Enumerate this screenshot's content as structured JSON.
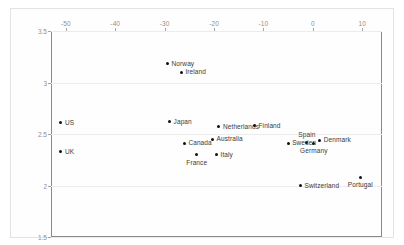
{
  "chart_data": {
    "type": "scatter",
    "title": "",
    "xlabel": "",
    "ylabel": "",
    "xlim": [
      -53,
      14
    ],
    "ylim": [
      1.5,
      3.5
    ],
    "xticks": [
      -50,
      -40,
      -30,
      -20,
      -10,
      0,
      10
    ],
    "xtick_labels": [
      "-50",
      "-40",
      "-30",
      "-20",
      "-10",
      "0",
      "10"
    ],
    "yticks": [
      1.5,
      2,
      2.5,
      3,
      3.5
    ],
    "ytick_labels": [
      "1.5",
      "2",
      "2.5",
      "3",
      "3.5"
    ],
    "grid": true,
    "grid_axis": "y",
    "legend": "none",
    "marker_color": "#111111",
    "points": [
      {
        "label": "Norway",
        "x": -29.4,
        "y": 3.18,
        "label_pos": "right"
      },
      {
        "label": "Ireland",
        "x": -26.6,
        "y": 3.1,
        "label_pos": "right"
      },
      {
        "label": "US",
        "x": -51.0,
        "y": 2.61,
        "label_pos": "right"
      },
      {
        "label": "Japan",
        "x": -29.0,
        "y": 2.62,
        "label_pos": "right"
      },
      {
        "label": "Netherlands",
        "x": -19.0,
        "y": 2.57,
        "label_pos": "right"
      },
      {
        "label": "Finland",
        "x": -11.8,
        "y": 2.58,
        "label_pos": "right"
      },
      {
        "label": "Spain",
        "x": -1.2,
        "y": 2.42,
        "label_pos": "above"
      },
      {
        "label": "Denmark",
        "x": 1.4,
        "y": 2.44,
        "label_pos": "right"
      },
      {
        "label": "Australia",
        "x": -20.3,
        "y": 2.45,
        "label_pos": "right"
      },
      {
        "label": "Canada",
        "x": -26.0,
        "y": 2.41,
        "label_pos": "right"
      },
      {
        "label": "Sweden",
        "x": -5.0,
        "y": 2.41,
        "label_pos": "right"
      },
      {
        "label": "Germany",
        "x": 0.2,
        "y": 2.41,
        "label_pos": "below"
      },
      {
        "label": "UK",
        "x": -51.0,
        "y": 2.33,
        "label_pos": "right"
      },
      {
        "label": "France",
        "x": -23.5,
        "y": 2.3,
        "label_pos": "below"
      },
      {
        "label": "Italy",
        "x": -19.5,
        "y": 2.3,
        "label_pos": "right"
      },
      {
        "label": "Switzerland",
        "x": -2.5,
        "y": 2.0,
        "label_pos": "right"
      },
      {
        "label": "Portugal",
        "x": 9.6,
        "y": 2.08,
        "label_pos": "below"
      }
    ]
  }
}
